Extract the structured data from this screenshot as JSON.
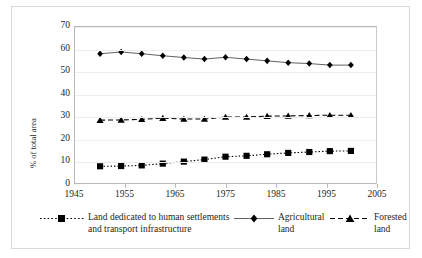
{
  "chart_data": {
    "type": "line",
    "title": "",
    "xlabel": "",
    "ylabel": "% of total area",
    "xlim": [
      1945,
      2005
    ],
    "ylim": [
      0,
      70
    ],
    "ytick_step": 10,
    "xtick_step": 10,
    "grid": "horizontal",
    "legend_position": "bottom",
    "xticks": [
      "1945",
      "1955",
      "1965",
      "1975",
      "1985",
      "1995",
      "2005"
    ],
    "yticks": [
      "0",
      "10",
      "20",
      "30",
      "40",
      "50",
      "60",
      "70"
    ],
    "x": [
      1950,
      1954.2,
      1958.3,
      1962.5,
      1966.7,
      1970.8,
      1975,
      1979.2,
      1983.3,
      1987.5,
      1991.7,
      1995.8,
      2000
    ],
    "series": [
      {
        "name": "Land dedicated to human settlements and transport infrastructure",
        "marker": "square",
        "line_style": "dotted",
        "color": "#000000",
        "values": [
          7.5,
          7.6,
          7.9,
          8.7,
          9.6,
          10.5,
          11.8,
          12.2,
          12.9,
          13.5,
          13.9,
          14.3,
          14.4
        ]
      },
      {
        "name": "Agricultural land",
        "marker": "diamond",
        "line_style": "solid",
        "color": "#000000",
        "values": [
          58.0,
          58.8,
          58.0,
          57.1,
          56.3,
          55.6,
          56.4,
          55.6,
          54.8,
          54.0,
          53.6,
          52.9,
          52.9
        ]
      },
      {
        "name": "Forested land",
        "marker": "triangle",
        "line_style": "dashed",
        "color": "#000000",
        "values": [
          28.2,
          28.3,
          28.6,
          29.1,
          28.7,
          28.7,
          29.6,
          29.6,
          30.0,
          30.1,
          30.3,
          30.4,
          30.4
        ]
      }
    ]
  },
  "legend": {
    "settlements": {
      "line1": "Land dedicated to human settlements",
      "line2": "and transport infrastructure"
    },
    "agricultural": {
      "line1": "Agricultural",
      "line2": "land"
    },
    "forested": {
      "line1": "Forested",
      "line2": "land"
    }
  }
}
